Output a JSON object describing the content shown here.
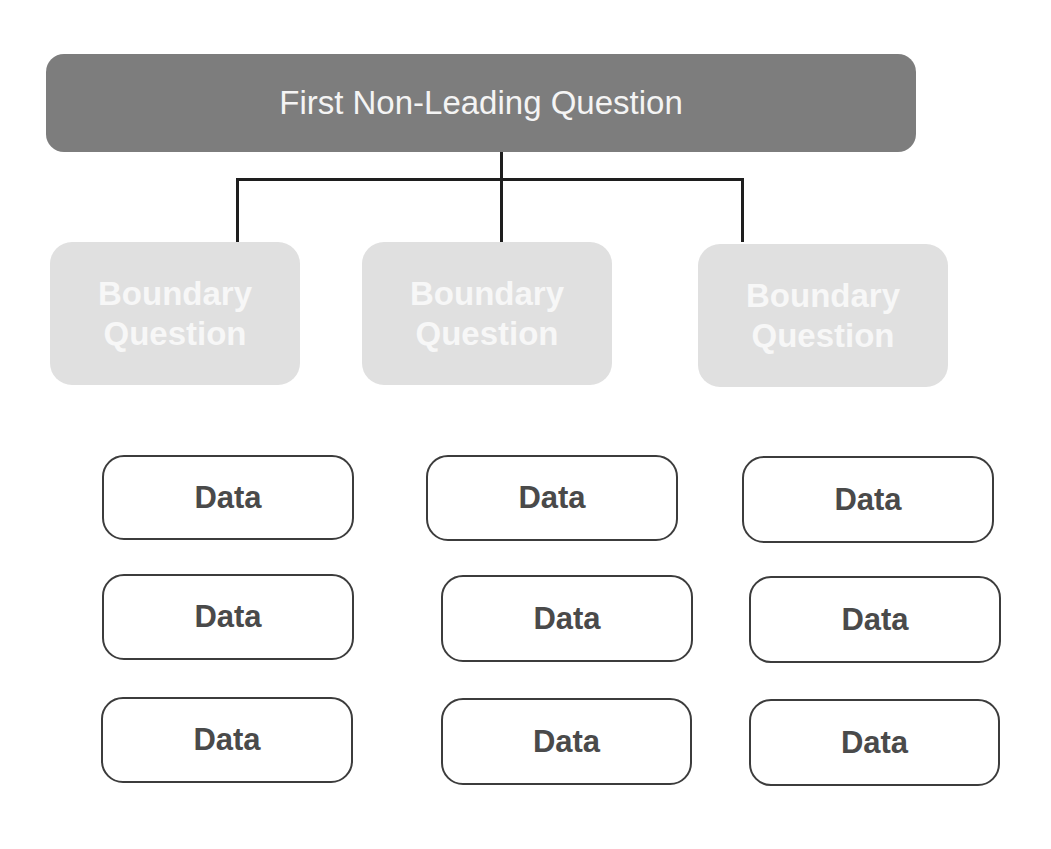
{
  "diagram": {
    "root": {
      "label": "First Non-Leading Question",
      "color": "#7d7d7d"
    },
    "boundary_questions": [
      {
        "label": "Boundary Question",
        "color": "#e0e0e0"
      },
      {
        "label": "Boundary Question",
        "color": "#e0e0e0"
      },
      {
        "label": "Boundary Question",
        "color": "#e0e0e0"
      }
    ],
    "data_columns": [
      {
        "items": [
          {
            "label": "Data"
          },
          {
            "label": "Data"
          },
          {
            "label": "Data"
          }
        ]
      },
      {
        "items": [
          {
            "label": "Data"
          },
          {
            "label": "Data"
          },
          {
            "label": "Data"
          }
        ]
      },
      {
        "items": [
          {
            "label": "Data"
          },
          {
            "label": "Data"
          },
          {
            "label": "Data"
          }
        ]
      }
    ]
  }
}
